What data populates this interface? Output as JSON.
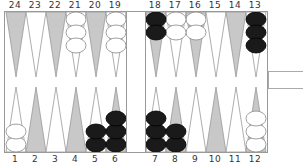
{
  "board": {
    "top_labels": [
      "24",
      "23",
      "22",
      "21",
      "20",
      "19",
      "18",
      "17",
      "16",
      "15",
      "14",
      "13"
    ],
    "bottom_labels": [
      "1",
      "2",
      "3",
      "4",
      "5",
      "6",
      "7",
      "8",
      "9",
      "10",
      "11",
      "12"
    ],
    "colors": {
      "dark_point": "#c8c8c8",
      "light_point": "#ffffff",
      "black_checker": "#1a1a1a",
      "white_checker": "#ffffff",
      "outline": "#999999"
    },
    "points": {
      "1": {
        "color": "white",
        "count": 2
      },
      "5": {
        "color": "black",
        "count": 2
      },
      "6": {
        "color": "black",
        "count": 3
      },
      "7": {
        "color": "black",
        "count": 3
      },
      "8": {
        "color": "black",
        "count": 2
      },
      "12": {
        "color": "white",
        "count": 3
      },
      "13": {
        "color": "black",
        "count": 3
      },
      "16": {
        "color": "white",
        "count": 2
      },
      "17": {
        "color": "white",
        "count": 2
      },
      "18": {
        "color": "black",
        "count": 2
      },
      "19": {
        "color": "white",
        "count": 3
      },
      "21": {
        "color": "white",
        "count": 3
      }
    }
  },
  "cube": {
    "label": ""
  }
}
